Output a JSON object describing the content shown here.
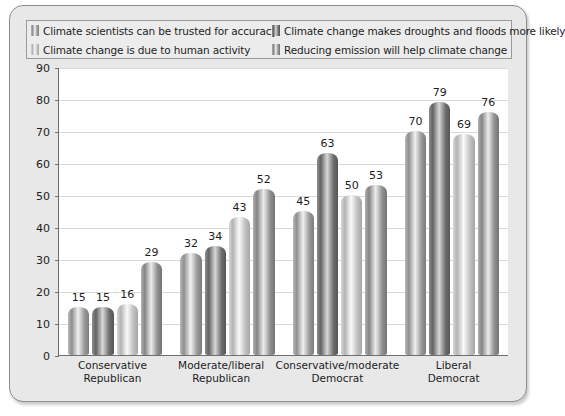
{
  "chart_data": {
    "type": "bar",
    "title": "",
    "xlabel": "",
    "ylabel": "",
    "ylim": [
      0,
      90
    ],
    "ytick_step": 10,
    "yticks": [
      90,
      80,
      70,
      60,
      50,
      40,
      30,
      20,
      10,
      0
    ],
    "grid": true,
    "legend_position": "top",
    "categories": [
      "Conservative\nRepublican",
      "Moderate/liberal\nRepublican",
      "Conservative/moderate\nDemocrat",
      "Liberal\nDemocrat"
    ],
    "category_lines": [
      [
        "Conservative",
        "Republican"
      ],
      [
        "Moderate/liberal",
        "Republican"
      ],
      [
        "Conservative/moderate",
        "Democrat"
      ],
      [
        "Liberal",
        "Democrat"
      ]
    ],
    "series": [
      {
        "name": "Climate scientists can be trusted for accuracy",
        "color": "#9a9a9a",
        "values": [
          15,
          32,
          45,
          70
        ]
      },
      {
        "name": "Climate change makes droughts and floods more likely",
        "color": "#6f6f6f",
        "values": [
          15,
          34,
          63,
          79
        ]
      },
      {
        "name": "Climate change is due to human activity",
        "color": "#c0c0c0",
        "values": [
          16,
          43,
          50,
          69
        ]
      },
      {
        "name": "Reducing emission will help climate change",
        "color": "#919191",
        "values": [
          29,
          52,
          53,
          76
        ]
      }
    ]
  },
  "legend": {
    "items": [
      {
        "label": "Climate scientists can be trusted for accuracy"
      },
      {
        "label": "Climate change makes droughts and floods more likely"
      },
      {
        "label": "Climate change is due to human activity"
      },
      {
        "label": "Reducing emission will help climate change"
      }
    ]
  }
}
